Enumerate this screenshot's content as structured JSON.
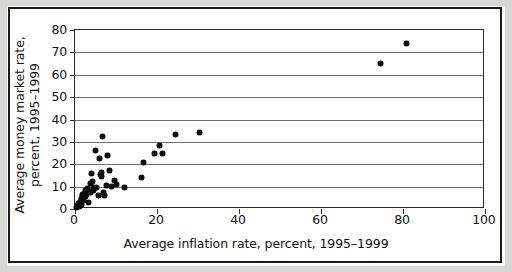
{
  "figure": {
    "background_color": "#ffffff",
    "frame_color": "#1a1a1a",
    "marker_color": "#0d0d0d",
    "gridline_color": "#6f6f6f"
  },
  "axes": {
    "x_label": "Average inflation rate, percent, 1995–1999",
    "y_label_line1": "Average money market rate,",
    "y_label_line2": "percent, 1995–1999",
    "x_ticks": [
      "0",
      "20",
      "40",
      "60",
      "80",
      "100"
    ],
    "y_ticks": [
      "0",
      "10",
      "20",
      "30",
      "40",
      "50",
      "60",
      "70",
      "80"
    ]
  },
  "chart_data": {
    "type": "scatter",
    "title": "",
    "xlabel": "Average inflation rate, percent, 1995–1999",
    "ylabel": "Average money market rate, percent, 1995–1999",
    "xlim": [
      0,
      100
    ],
    "ylim": [
      0,
      80
    ],
    "xticks": [
      0,
      20,
      40,
      60,
      80,
      100
    ],
    "yticks": [
      0,
      10,
      20,
      30,
      40,
      50,
      60,
      70,
      80
    ],
    "grid": "horizontal",
    "legend": null,
    "marker": "diamond",
    "series": [
      {
        "name": "Countries",
        "points": [
          [
            0.4,
            0.6
          ],
          [
            0.7,
            1.4
          ],
          [
            0.9,
            2.6
          ],
          [
            1.1,
            1.0
          ],
          [
            1.3,
            3.4
          ],
          [
            1.5,
            4.6
          ],
          [
            1.6,
            2.2
          ],
          [
            1.8,
            5.4
          ],
          [
            1.9,
            6.4
          ],
          [
            2.1,
            4.0
          ],
          [
            2.3,
            7.0
          ],
          [
            2.5,
            5.8
          ],
          [
            2.6,
            8.2
          ],
          [
            2.8,
            6.6
          ],
          [
            3.0,
            7.6
          ],
          [
            3.1,
            9.0
          ],
          [
            3.3,
            3.0
          ],
          [
            3.5,
            8.0
          ],
          [
            3.7,
            7.2
          ],
          [
            3.9,
            11.6
          ],
          [
            4.0,
            16.0
          ],
          [
            4.2,
            12.4
          ],
          [
            4.4,
            8.4
          ],
          [
            4.6,
            9.8
          ],
          [
            5.0,
            26.0
          ],
          [
            5.3,
            9.6
          ],
          [
            5.8,
            6.0
          ],
          [
            6.0,
            22.4
          ],
          [
            6.2,
            15.2
          ],
          [
            6.4,
            16.2
          ],
          [
            6.5,
            14.4
          ],
          [
            6.6,
            32.2
          ],
          [
            7.0,
            7.2
          ],
          [
            7.3,
            6.0
          ],
          [
            7.6,
            10.6
          ],
          [
            8.0,
            23.8
          ],
          [
            8.4,
            17.2
          ],
          [
            8.8,
            10.2
          ],
          [
            9.6,
            12.8
          ],
          [
            10.2,
            11.0
          ],
          [
            12.0,
            9.8
          ],
          [
            16.2,
            14.0
          ],
          [
            16.6,
            20.8
          ],
          [
            19.4,
            25.0
          ],
          [
            20.6,
            28.4
          ],
          [
            21.4,
            24.8
          ],
          [
            24.6,
            33.4
          ],
          [
            30.4,
            34.2
          ],
          [
            74.6,
            65.0
          ],
          [
            80.8,
            73.8
          ]
        ]
      }
    ]
  }
}
